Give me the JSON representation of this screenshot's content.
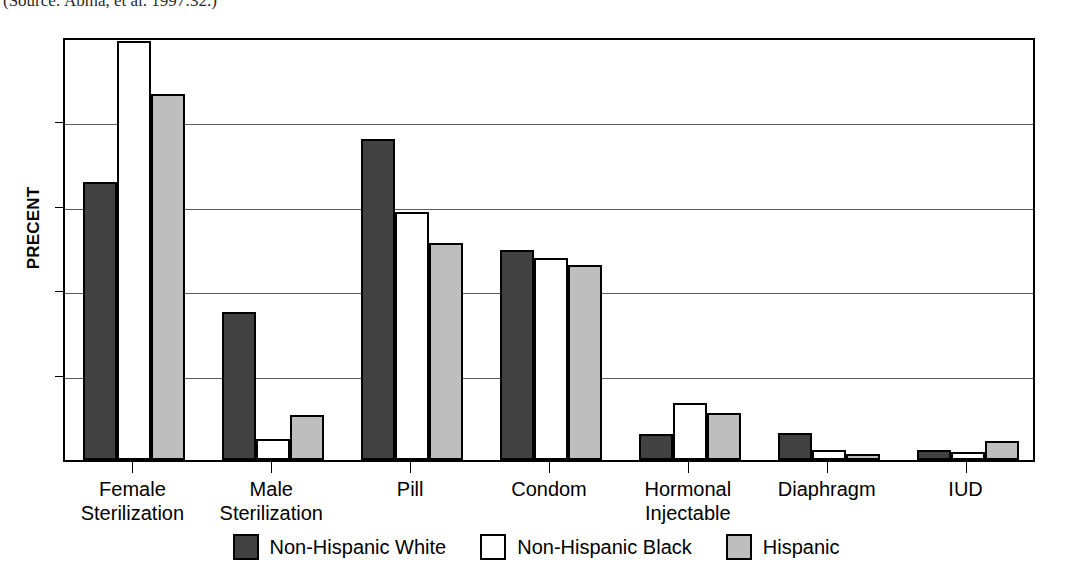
{
  "source_note": "(Source: Abma, et al. 1997:32.)",
  "chart_data": {
    "type": "bar",
    "title": "",
    "xlabel": "",
    "ylabel": "PRECENT",
    "ylim": [
      0,
      25
    ],
    "yticks": [
      0,
      5,
      10,
      15,
      20,
      25
    ],
    "ytick_labels": [
      "0",
      "5",
      "10",
      "15",
      "20",
      "25"
    ],
    "grid": true,
    "legend_position": "bottom",
    "categories": [
      "Female\nSterilization",
      "Male\nSterilization",
      "Pill",
      "Condom",
      "Hormonal\nInjectable",
      "Diaphragm",
      "IUD"
    ],
    "series": [
      {
        "name": "Non-Hispanic White",
        "color": "#414141",
        "values": [
          16.4,
          8.7,
          18.9,
          12.4,
          1.55,
          1.6,
          0.6
        ]
      },
      {
        "name": "Non-Hispanic Black",
        "color": "#ffffff",
        "values": [
          24.7,
          1.25,
          14.6,
          11.9,
          3.35,
          0.6,
          0.5
        ]
      },
      {
        "name": "Hispanic",
        "color": "#bebebe",
        "values": [
          21.6,
          2.65,
          12.8,
          11.5,
          2.8,
          0.35,
          1.1
        ]
      }
    ]
  }
}
